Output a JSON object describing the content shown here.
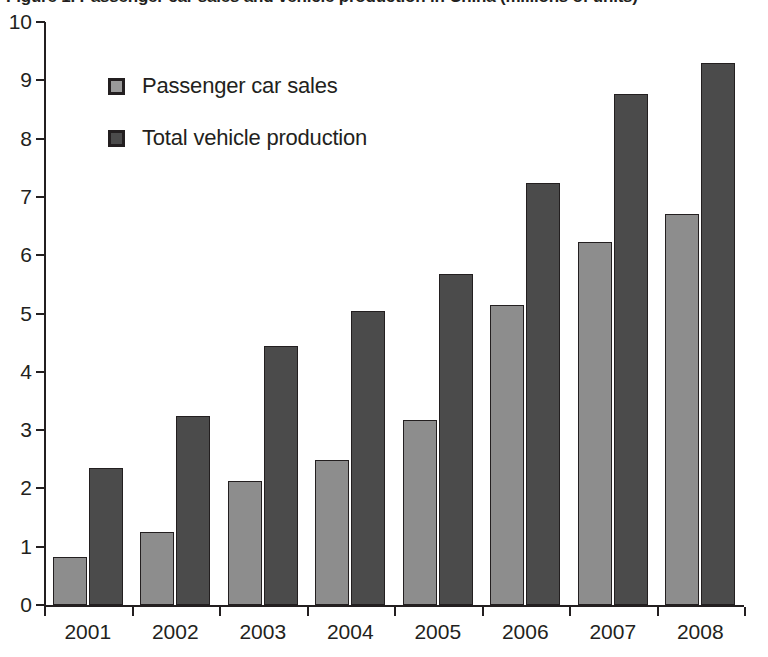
{
  "chart_data": {
    "type": "bar",
    "title": "Figure 1. Passenger car sales and vehicle production in China (millions of units)",
    "xlabel": "",
    "ylabel": "",
    "ylim": [
      0,
      10
    ],
    "y_ticks": [
      "0",
      "1",
      "2",
      "3",
      "4",
      "5",
      "6",
      "7",
      "8",
      "9",
      "10"
    ],
    "grid": false,
    "legend_position": "inside-top-left",
    "categories": [
      "2001",
      "2002",
      "2003",
      "2004",
      "2005",
      "2006",
      "2007",
      "2008"
    ],
    "series": [
      {
        "name": "Passenger car sales",
        "color": "#8d8d8d",
        "values": [
          0.83,
          1.25,
          2.13,
          2.49,
          3.18,
          5.15,
          6.22,
          6.7
        ]
      },
      {
        "name": "Total vehicle production",
        "color": "#4b4b4b",
        "values": [
          2.35,
          3.25,
          4.44,
          5.05,
          5.68,
          7.23,
          8.77,
          9.3
        ]
      }
    ]
  },
  "legend": {
    "items": [
      {
        "label": "Passenger car sales",
        "swatch": "light"
      },
      {
        "label": "Total vehicle production",
        "swatch": "dark"
      }
    ]
  },
  "colors": {
    "axis": "#231f20",
    "series_light": "#8d8d8d",
    "series_dark": "#4b4b4b",
    "background": "#ffffff"
  }
}
